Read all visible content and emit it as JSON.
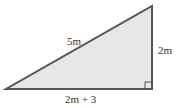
{
  "diagram": {
    "type": "right-triangle",
    "labels": {
      "hypotenuse": "5m",
      "vertical_leg": "2m",
      "base": "2m + 3"
    },
    "colors": {
      "fill": "#e6e6e6",
      "stroke": "#555555",
      "text": "#333333"
    },
    "vertices": {
      "left": [
        6,
        89
      ],
      "right_angle": [
        152,
        89
      ],
      "top": [
        152,
        6
      ]
    }
  }
}
